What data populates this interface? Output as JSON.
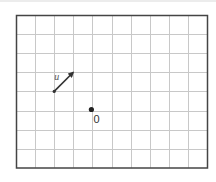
{
  "figure": {
    "type": "grid-diagram",
    "grid": {
      "columns": 10,
      "rows": 8,
      "origin_px": [
        16,
        15
      ],
      "cell_px": 19.1,
      "line_color": "#c8c8c8",
      "border_color": "#444444"
    },
    "vector": {
      "label": "u",
      "label_display": "u⃗",
      "start_cell": [
        2,
        4
      ],
      "end_cell": [
        3,
        3
      ],
      "components": [
        1,
        1
      ],
      "color": "#333333"
    },
    "point": {
      "label": "O",
      "label_display": "0",
      "cell": [
        4,
        5
      ],
      "color": "#222222"
    }
  }
}
